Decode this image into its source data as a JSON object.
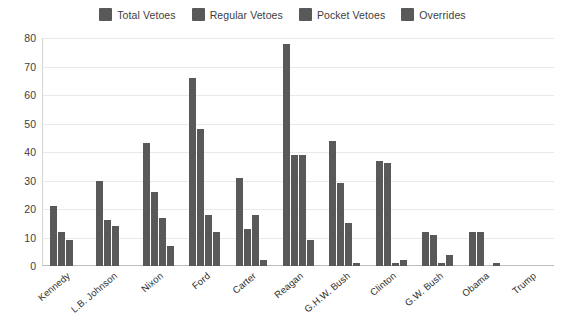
{
  "legend": {
    "position": "top-center",
    "items": [
      {
        "label": "Total Vetoes",
        "color": "#595959",
        "icon": "legend-swatch"
      },
      {
        "label": "Regular Vetoes",
        "color": "#595959",
        "icon": "legend-swatch"
      },
      {
        "label": "Pocket Vetoes",
        "color": "#595959",
        "icon": "legend-swatch"
      },
      {
        "label": "Overrides",
        "color": "#595959",
        "icon": "legend-swatch"
      }
    ]
  },
  "axes": {
    "yticks": [
      "80",
      "70",
      "60",
      "50",
      "40",
      "30",
      "20",
      "10",
      "0"
    ],
    "ylim_min": 0,
    "ylim_max": 80,
    "ystep": 10
  },
  "chart_data": {
    "type": "bar",
    "title": "",
    "subtitle": "",
    "xlabel": "",
    "ylabel": "",
    "ylim": [
      0,
      80
    ],
    "ytick_step": 10,
    "grid": true,
    "legend_position": "top-center",
    "bar_color": "#595959",
    "categories": [
      "Kennedy",
      "L.B. Johnson",
      "Nixon",
      "Ford",
      "Carter",
      "Reagan",
      "G.H.W. Bush",
      "Clinton",
      "G.W. Bush",
      "Obama",
      "Trump"
    ],
    "series": [
      {
        "name": "Total Vetoes",
        "color": "#595959",
        "values": [
          21,
          30,
          43,
          66,
          31,
          78,
          44,
          37,
          12,
          12,
          0
        ]
      },
      {
        "name": "Regular Vetoes",
        "color": "#595959",
        "values": [
          12,
          16,
          26,
          48,
          13,
          39,
          29,
          36,
          11,
          12,
          0
        ]
      },
      {
        "name": "Pocket Vetoes",
        "color": "#595959",
        "values": [
          9,
          14,
          17,
          18,
          18,
          39,
          15,
          1,
          1,
          0,
          0
        ]
      },
      {
        "name": "Overrides",
        "color": "#595959",
        "values": [
          0,
          0,
          7,
          12,
          2,
          9,
          1,
          2,
          4,
          1,
          0
        ]
      }
    ]
  }
}
